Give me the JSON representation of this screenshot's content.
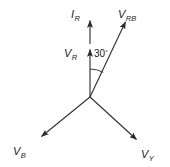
{
  "diagram": {
    "type": "phasor-diagram",
    "background_color": "#ffffff",
    "line_color": "#333333",
    "text_color": "#1a1a1a",
    "origin": {
      "x": 90,
      "y": 97
    },
    "angle": {
      "value": "30",
      "degree_symbol": "°",
      "between": [
        "V_R",
        "V_RB"
      ],
      "arc_radius": 28
    },
    "vectors": [
      {
        "id": "IR",
        "label_main": "I",
        "label_sub": "R",
        "direction_deg": 90,
        "tip": {
          "x": 90,
          "y": 20
        },
        "tail": {
          "x": 90,
          "y": 44
        },
        "label_pos": {
          "x": 71,
          "y": 14
        },
        "detached": true
      },
      {
        "id": "VR",
        "label_main": "V",
        "label_sub": "R",
        "direction_deg": 90,
        "tip": {
          "x": 90,
          "y": 49
        },
        "tail": {
          "x": 90,
          "y": 97
        },
        "label_pos": {
          "x": 64,
          "y": 58
        },
        "detached": false
      },
      {
        "id": "VRB",
        "label_main": "V",
        "label_sub": "RB",
        "direction_deg": 65,
        "tip": {
          "x": 126,
          "y": 21
        },
        "tail": {
          "x": 90,
          "y": 97
        },
        "label_pos": {
          "x": 119,
          "y": 16
        },
        "detached": false
      },
      {
        "id": "VB",
        "label_main": "V",
        "label_sub": "B",
        "direction_deg": 218,
        "tip": {
          "x": 41,
          "y": 137
        },
        "tail": {
          "x": 90,
          "y": 97
        },
        "label_pos": {
          "x": 13,
          "y": 157
        },
        "detached": false
      },
      {
        "id": "VY",
        "label_main": "V",
        "label_sub": "Y",
        "direction_deg": 321,
        "tip": {
          "x": 137,
          "y": 140
        },
        "tail": {
          "x": 90,
          "y": 97
        },
        "label_pos": {
          "x": 142,
          "y": 158
        },
        "detached": false
      }
    ]
  }
}
